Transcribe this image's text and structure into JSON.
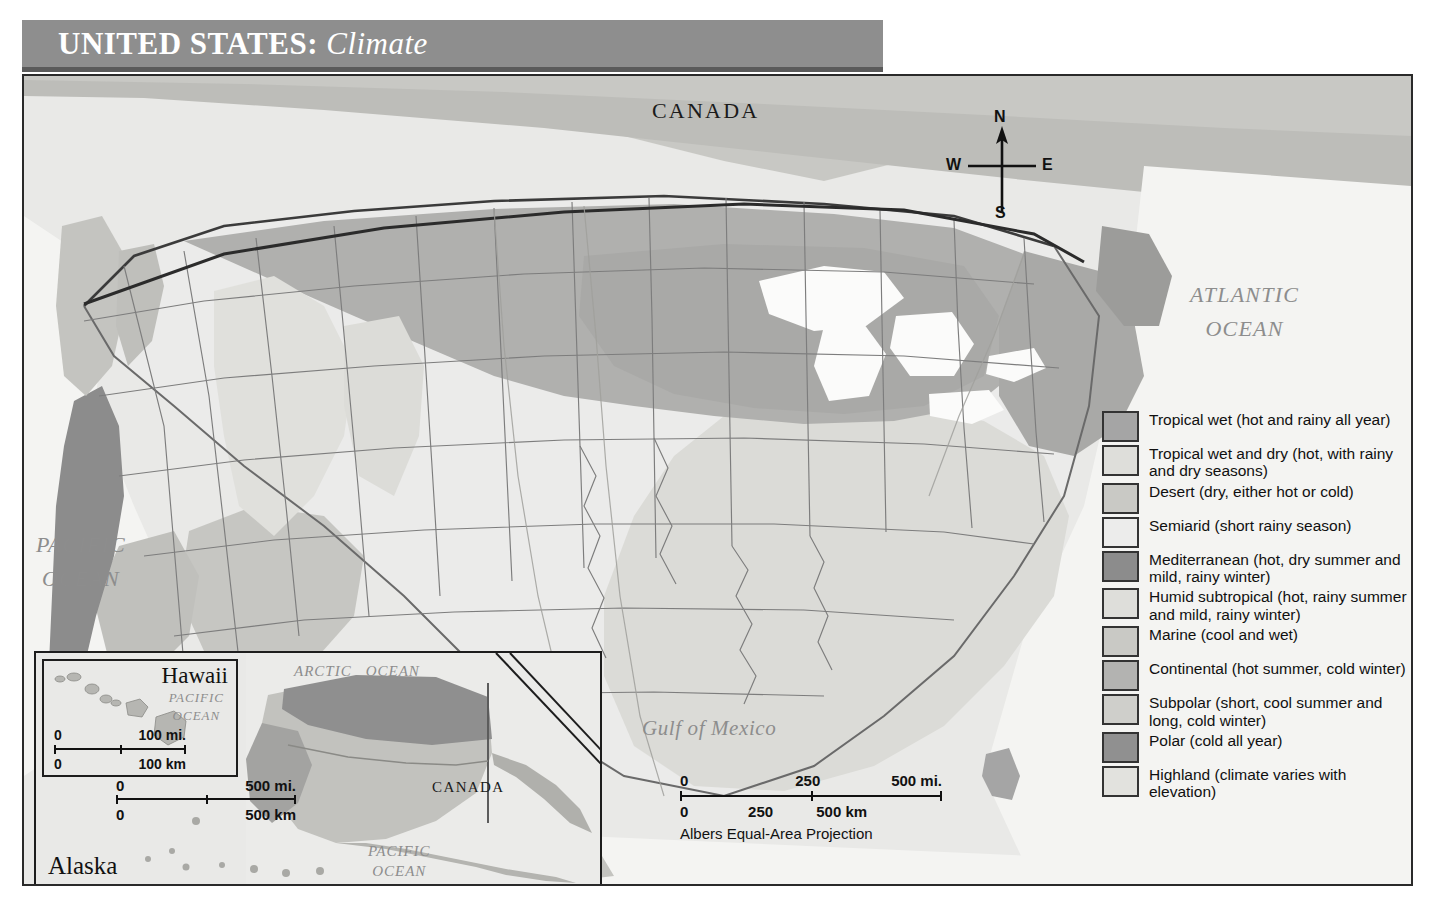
{
  "title": {
    "main": "UNITED STATES:",
    "subtitle": "Climate"
  },
  "map_labels": {
    "canada": "CANADA",
    "mexico": "MEXICO",
    "atlantic_ocean": "ATLANTIC OCEAN",
    "atlantic_line1": "ATLANTIC",
    "atlantic_line2": "OCEAN",
    "pacific_line1": "PACIFIC",
    "pacific_line2": "OCEAN",
    "gulf_of_mexico": "Gulf of Mexico"
  },
  "compass": {
    "north": "N",
    "south": "S",
    "east": "E",
    "west": "W"
  },
  "scale_bar": {
    "miles_start": "0",
    "miles_mid": "250",
    "miles_end": "500 mi.",
    "km_start": "0",
    "km_mid": "250",
    "km_end": "500 km",
    "projection": "Albers Equal-Area Projection"
  },
  "insets": {
    "hawaii": {
      "title": "Hawaii",
      "ocean_line1": "PACIFIC",
      "ocean_line2": "OCEAN",
      "scale": {
        "miles_start": "0",
        "miles_end": "100 mi.",
        "km_start": "0",
        "km_end": "100 km"
      }
    },
    "alaska": {
      "title": "Alaska",
      "arctic_line1": "ARCTIC",
      "arctic_line2": "OCEAN",
      "pacific_line1": "PACIFIC",
      "pacific_line2": "OCEAN",
      "canada": "CANADA",
      "scale": {
        "miles_start": "0",
        "miles_end": "500 mi.",
        "km_start": "0",
        "km_end": "500 km"
      }
    }
  },
  "legend": {
    "items": [
      {
        "label": "Tropical wet (hot and rainy all year)",
        "color": "#a5a5a5"
      },
      {
        "label": "Tropical wet and dry (hot, with rainy and dry seasons)",
        "color": "#dededa"
      },
      {
        "label": "Desert (dry, either hot or cold)",
        "color": "#c9c9c5"
      },
      {
        "label": "Semiarid (short rainy season)",
        "color": "#ececeb"
      },
      {
        "label": "Mediterranean (hot, dry summer and mild, rainy winter)",
        "color": "#8c8c8c"
      },
      {
        "label": "Humid subtropical (hot, rainy summer and mild, rainy winter)",
        "color": "#dededa"
      },
      {
        "label": "Marine (cool and wet)",
        "color": "#c9c9c5"
      },
      {
        "label": "Continental (hot summer, cold winter)",
        "color": "#b3b3b1"
      },
      {
        "label": "Subpolar (short, cool summer and long, cold winter)",
        "color": "#cfcfcb"
      },
      {
        "label": "Polar (cold all year)",
        "color": "#909090"
      },
      {
        "label": "Highland (climate varies with elevation)",
        "color": "#e2e2de"
      }
    ]
  },
  "chart_data": {
    "type": "map",
    "title": "UNITED STATES: Climate",
    "projection": "Albers Equal-Area Projection",
    "categories": [
      "Tropical wet",
      "Tropical wet and dry",
      "Desert",
      "Semiarid",
      "Mediterranean",
      "Humid subtropical",
      "Marine",
      "Continental",
      "Subpolar",
      "Polar",
      "Highland"
    ],
    "legend_position": "right"
  }
}
